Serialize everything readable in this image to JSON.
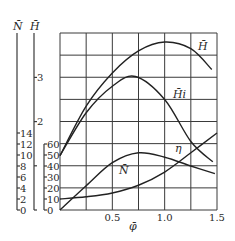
{
  "chart_data": {
    "type": "line",
    "title": "",
    "xlabel": "φ̄",
    "xlim": [
      0,
      1.5
    ],
    "x_ticks": [
      0.5,
      1.0,
      1.5
    ],
    "x_tick_labels": [
      "0.5",
      "1.0",
      "1.5"
    ],
    "grid": true,
    "grid_x_step": 0.25,
    "y_axes": [
      {
        "name": "N̄",
        "label": "N̄",
        "range": [
          0,
          14
        ],
        "ticks": [
          0,
          2,
          4,
          6,
          8,
          10,
          12,
          14
        ],
        "tick_labels": [
          "0",
          "2",
          "4",
          "6",
          "8",
          "10",
          "12",
          "14"
        ]
      },
      {
        "name": "H̄",
        "label": "H̄",
        "range": [
          0,
          3
        ],
        "ticks": [
          0,
          1,
          2,
          3
        ],
        "tick_labels": [
          "",
          "",
          "2",
          "3"
        ]
      },
      {
        "name": "η",
        "label": "",
        "range": [
          0,
          60
        ],
        "ticks": [
          0,
          10,
          20,
          30,
          40,
          50,
          60
        ],
        "tick_labels": [
          "0",
          "10",
          "20",
          "30",
          "40",
          "50",
          "60"
        ]
      }
    ],
    "x": [
      0,
      0.25,
      0.5,
      0.75,
      1.0,
      1.25,
      1.5
    ],
    "series": [
      {
        "name": "H̄",
        "axis": "H̄",
        "x": [
          0,
          0.25,
          0.5,
          0.75,
          1.0,
          1.25,
          1.45
        ],
        "values": [
          1.23,
          2.35,
          3.1,
          3.6,
          3.8,
          3.65,
          3.18
        ]
      },
      {
        "name": "H̄i",
        "axis": "H̄",
        "x": [
          0,
          0.25,
          0.5,
          0.72,
          1.0,
          1.25,
          1.46
        ],
        "values": [
          1.23,
          2.2,
          2.8,
          3.02,
          2.5,
          1.55,
          1.09
        ]
      },
      {
        "name": "η",
        "axis": "η",
        "x": [
          0,
          0.25,
          0.5,
          0.75,
          1.0,
          1.25,
          1.48
        ],
        "values": [
          0,
          22,
          43,
          52,
          48,
          40,
          33
        ]
      },
      {
        "name": "N̄",
        "axis": "N̄",
        "x": [
          0,
          0.25,
          0.5,
          0.75,
          1.0,
          1.25,
          1.5
        ],
        "values": [
          2.0,
          2.4,
          3.1,
          4.5,
          6.9,
          10.4,
          14.0
        ]
      }
    ],
    "annotations": [
      {
        "text": "H̄",
        "near": "H̄ curve, right end"
      },
      {
        "text": "H̄i",
        "near": "H̄i curve, descending part"
      },
      {
        "text": "η",
        "near": "η curve, near crossing"
      },
      {
        "text": "N̄",
        "near": "below η hump"
      }
    ]
  },
  "labels": {
    "N_axis": "N̄",
    "H_axis": "H̄",
    "x_axis": "φ̄",
    "H_curve": "H̄",
    "Hi_curve": "H̄i",
    "eta_curve": "η",
    "N_curve": "N̄"
  }
}
